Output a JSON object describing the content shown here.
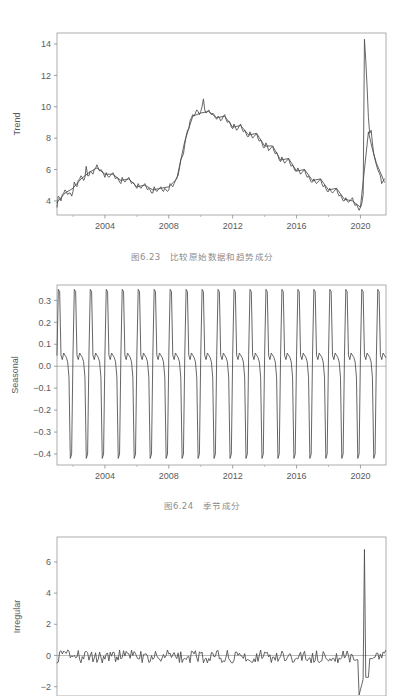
{
  "figures": [
    {
      "id": "trend",
      "caption": "图6.23　比较原始数据和趋势成分",
      "ylabel": "Trend"
    },
    {
      "id": "seasonal",
      "caption": "图6.24　季节成分",
      "ylabel": "Seasonal"
    },
    {
      "id": "irregular",
      "caption": "",
      "ylabel": "Irregular"
    }
  ],
  "chart_data": [
    {
      "type": "line",
      "title": "",
      "caption": "图6.23　比较原始数据和趋势成分",
      "xlabel": "",
      "ylabel": "Trend",
      "xlim": [
        2001.0,
        2021.6
      ],
      "ylim": [
        3.1,
        14.7
      ],
      "yticks": [
        4,
        6,
        8,
        10,
        12,
        14
      ],
      "xticks": [
        2004,
        2008,
        2012,
        2016,
        2020
      ],
      "xticks_minor": [
        2002,
        2006,
        2010,
        2014,
        2018
      ],
      "grid": false,
      "legend": "none",
      "line_color": "#4a4a4a",
      "series": [
        {
          "name": "Original",
          "x": [
            2001.0,
            2001.08,
            2001.17,
            2001.25,
            2001.33,
            2001.42,
            2001.5,
            2001.58,
            2001.67,
            2001.75,
            2001.83,
            2001.92,
            2002.0,
            2002.08,
            2002.17,
            2002.25,
            2002.33,
            2002.42,
            2002.5,
            2002.58,
            2002.67,
            2002.75,
            2002.83,
            2002.92,
            2003.0,
            2003.08,
            2003.17,
            2003.25,
            2003.33,
            2003.42,
            2003.5,
            2003.58,
            2003.67,
            2003.75,
            2003.83,
            2003.92,
            2004.0,
            2004.08,
            2004.17,
            2004.25,
            2004.33,
            2004.42,
            2004.5,
            2004.58,
            2004.67,
            2004.75,
            2004.83,
            2004.92,
            2005.0,
            2005.08,
            2005.17,
            2005.25,
            2005.33,
            2005.42,
            2005.5,
            2005.58,
            2005.67,
            2005.75,
            2005.83,
            2005.92,
            2006.0,
            2006.08,
            2006.17,
            2006.25,
            2006.33,
            2006.42,
            2006.5,
            2006.58,
            2006.67,
            2006.75,
            2006.83,
            2006.92,
            2007.0,
            2007.08,
            2007.17,
            2007.25,
            2007.33,
            2007.42,
            2007.5,
            2007.58,
            2007.67,
            2007.75,
            2007.83,
            2007.92,
            2008.0,
            2008.08,
            2008.17,
            2008.25,
            2008.33,
            2008.42,
            2008.5,
            2008.58,
            2008.67,
            2008.75,
            2008.83,
            2008.92,
            2009.0,
            2009.08,
            2009.17,
            2009.25,
            2009.33,
            2009.42,
            2009.5,
            2009.58,
            2009.67,
            2009.75,
            2009.83,
            2009.92,
            2010.0,
            2010.08,
            2010.17,
            2010.25,
            2010.33,
            2010.42,
            2010.5,
            2010.58,
            2010.67,
            2010.75,
            2010.83,
            2010.92,
            2011.0,
            2011.08,
            2011.17,
            2011.25,
            2011.33,
            2011.42,
            2011.5,
            2011.58,
            2011.67,
            2011.75,
            2011.83,
            2011.92,
            2012.0,
            2012.08,
            2012.17,
            2012.25,
            2012.33,
            2012.42,
            2012.5,
            2012.58,
            2012.67,
            2012.75,
            2012.83,
            2012.92,
            2013.0,
            2013.08,
            2013.17,
            2013.25,
            2013.33,
            2013.42,
            2013.5,
            2013.58,
            2013.67,
            2013.75,
            2013.83,
            2013.92,
            2014.0,
            2014.08,
            2014.17,
            2014.25,
            2014.33,
            2014.42,
            2014.5,
            2014.58,
            2014.67,
            2014.75,
            2014.83,
            2014.92,
            2015.0,
            2015.08,
            2015.17,
            2015.25,
            2015.33,
            2015.42,
            2015.5,
            2015.58,
            2015.67,
            2015.75,
            2015.83,
            2015.92,
            2016.0,
            2016.08,
            2016.17,
            2016.25,
            2016.33,
            2016.42,
            2016.5,
            2016.58,
            2016.67,
            2016.75,
            2016.83,
            2016.92,
            2017.0,
            2017.08,
            2017.17,
            2017.25,
            2017.33,
            2017.42,
            2017.5,
            2017.58,
            2017.67,
            2017.75,
            2017.83,
            2017.92,
            2018.0,
            2018.08,
            2018.17,
            2018.25,
            2018.33,
            2018.42,
            2018.5,
            2018.58,
            2018.67,
            2018.75,
            2018.83,
            2018.92,
            2019.0,
            2019.08,
            2019.17,
            2019.25,
            2019.33,
            2019.42,
            2019.5,
            2019.58,
            2019.67,
            2019.75,
            2019.83,
            2019.92,
            2020.0,
            2020.08,
            2020.17,
            2020.25,
            2020.33,
            2020.42,
            2020.5,
            2020.58,
            2020.67,
            2020.75,
            2020.83,
            2020.92,
            2021.0,
            2021.08,
            2021.17,
            2021.25,
            2021.33,
            2021.5
          ],
          "y": [
            3.6,
            4.3,
            4.2,
            4.0,
            4.4,
            4.5,
            4.7,
            4.6,
            4.4,
            4.5,
            4.5,
            4.3,
            4.6,
            5.2,
            5.0,
            4.9,
            5.3,
            5.4,
            5.6,
            5.5,
            5.3,
            5.5,
            6.2,
            5.6,
            5.6,
            5.9,
            5.8,
            5.7,
            6.0,
            6.1,
            6.3,
            6.1,
            5.9,
            6.0,
            5.9,
            5.7,
            5.5,
            5.8,
            5.6,
            5.5,
            5.6,
            5.7,
            5.8,
            5.6,
            5.4,
            5.5,
            5.4,
            5.2,
            5.1,
            5.5,
            5.3,
            5.2,
            5.3,
            5.4,
            5.5,
            5.3,
            5.1,
            5.2,
            5.1,
            4.9,
            4.8,
            5.1,
            4.9,
            4.8,
            4.9,
            5.0,
            5.1,
            4.9,
            4.7,
            4.8,
            4.7,
            4.5,
            4.5,
            4.9,
            4.7,
            4.6,
            4.7,
            4.8,
            4.9,
            4.7,
            4.6,
            4.8,
            4.7,
            4.6,
            4.7,
            5.1,
            5.0,
            4.9,
            5.1,
            5.3,
            5.5,
            5.6,
            6.1,
            6.6,
            6.8,
            7.0,
            7.6,
            8.1,
            8.5,
            8.6,
            9.1,
            9.3,
            9.5,
            9.4,
            9.6,
            9.8,
            9.7,
            9.5,
            9.7,
            10.0,
            10.5,
            9.8,
            9.6,
            9.7,
            9.8,
            9.6,
            9.5,
            9.6,
            9.5,
            9.3,
            9.2,
            9.4,
            9.3,
            9.1,
            9.2,
            9.4,
            9.5,
            9.2,
            9.0,
            9.1,
            9.0,
            8.7,
            8.6,
            8.9,
            8.7,
            8.5,
            8.6,
            8.8,
            8.9,
            8.6,
            8.4,
            8.5,
            8.3,
            8.1,
            8.1,
            8.4,
            8.2,
            8.0,
            8.1,
            8.2,
            8.3,
            8.0,
            7.8,
            7.9,
            7.7,
            7.4,
            7.4,
            7.7,
            7.5,
            7.2,
            7.3,
            7.4,
            7.5,
            7.2,
            7.0,
            7.1,
            6.9,
            6.6,
            6.5,
            6.8,
            6.6,
            6.4,
            6.5,
            6.6,
            6.7,
            6.4,
            6.2,
            6.3,
            6.1,
            5.9,
            5.9,
            6.1,
            5.9,
            5.7,
            5.8,
            5.9,
            6.0,
            5.7,
            5.5,
            5.6,
            5.4,
            5.2,
            5.2,
            5.4,
            5.2,
            5.1,
            5.2,
            5.3,
            5.4,
            5.1,
            4.9,
            5.0,
            4.8,
            4.6,
            4.6,
            4.8,
            4.6,
            4.5,
            4.6,
            4.7,
            4.8,
            4.5,
            4.3,
            4.4,
            4.2,
            4.0,
            4.0,
            4.2,
            4.0,
            3.9,
            4.0,
            4.1,
            4.2,
            3.9,
            3.7,
            3.8,
            3.6,
            3.4,
            3.6,
            3.8,
            4.4,
            14.3,
            13.0,
            11.2,
            9.3,
            8.3,
            8.5,
            7.7,
            7.0,
            6.6,
            6.3,
            6.0,
            5.8,
            5.6,
            5.1,
            5.4
          ]
        },
        {
          "name": "Trend",
          "x": [
            2001.0,
            2001.5,
            2002.0,
            2002.5,
            2003.0,
            2003.5,
            2004.0,
            2004.5,
            2005.0,
            2005.5,
            2006.0,
            2006.5,
            2007.0,
            2007.5,
            2008.0,
            2008.5,
            2009.0,
            2009.5,
            2010.0,
            2010.5,
            2011.0,
            2011.5,
            2012.0,
            2012.5,
            2013.0,
            2013.5,
            2014.0,
            2014.5,
            2015.0,
            2015.5,
            2016.0,
            2016.5,
            2017.0,
            2017.5,
            2018.0,
            2018.5,
            2019.0,
            2019.5,
            2020.0,
            2020.25,
            2020.5,
            2020.75,
            2021.0,
            2021.5
          ],
          "y": [
            3.9,
            4.5,
            4.8,
            5.4,
            5.8,
            6.1,
            5.7,
            5.7,
            5.3,
            5.4,
            4.9,
            5.0,
            4.7,
            4.8,
            4.9,
            5.4,
            7.8,
            9.4,
            9.6,
            9.7,
            9.3,
            9.4,
            8.7,
            8.8,
            8.2,
            8.3,
            7.5,
            7.5,
            6.6,
            6.7,
            5.9,
            6.0,
            5.3,
            5.4,
            4.7,
            4.8,
            4.1,
            4.0,
            3.6,
            6.0,
            8.4,
            7.3,
            6.4,
            5.2
          ]
        }
      ]
    },
    {
      "type": "line",
      "title": "",
      "caption": "图6.24　季节成分",
      "xlabel": "",
      "ylabel": "Seasonal",
      "xlim": [
        2001.0,
        2021.6
      ],
      "ylim": [
        -0.45,
        0.37
      ],
      "yticks": [
        0.3,
        0.2,
        0.1,
        0.0,
        -0.1,
        -0.2,
        -0.3,
        -0.4
      ],
      "ytick_labels": [
        "0.3",
        "0.2",
        "0.1",
        "0.0",
        "-0.1",
        "-0.2",
        "-0.3",
        "-0.4"
      ],
      "xticks": [
        2004,
        2008,
        2012,
        2016,
        2020
      ],
      "xticks_minor": [
        2002,
        2006,
        2010,
        2014,
        2018
      ],
      "grid": false,
      "legend": "none",
      "zero_line": 0.0,
      "line_color": "#4a4a4a",
      "period_years": 1,
      "seasonal_pattern": {
        "note": "Repeating annual sawtooth: sharp rise to ~0.35 peak, small notch near 0.05, deep trough at ~-0.42",
        "months": [
          1,
          2,
          3,
          4,
          5,
          6,
          7,
          8,
          9,
          10,
          11,
          12
        ],
        "values": [
          0.05,
          0.35,
          0.34,
          0.05,
          0.03,
          0.06,
          0.05,
          0.04,
          0.02,
          -0.05,
          -0.42,
          -0.4
        ]
      }
    },
    {
      "type": "line",
      "title": "",
      "caption": "",
      "xlabel": "",
      "ylabel": "Irregular",
      "xlim": [
        2001.0,
        2021.6
      ],
      "ylim": [
        -2.6,
        7.6
      ],
      "yticks": [
        6,
        4,
        2,
        0,
        -2
      ],
      "xticks": [
        2004,
        2008,
        2012,
        2016,
        2020
      ],
      "grid": false,
      "legend": "none",
      "zero_line": 0.0,
      "line_color": "#4a4a4a",
      "note": "Mostly flat noise around 0 (amplitude ±0.5) with a large positive spike of 6.8 near 2020.3 and a negative dip to about -2.6",
      "spike_peak": 6.8,
      "spike_x": 2020.3
    }
  ]
}
